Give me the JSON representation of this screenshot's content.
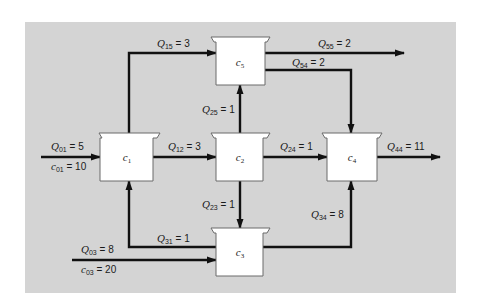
{
  "diagram": {
    "type": "reactor-network",
    "background_color": "#d4d4d4",
    "reactors": [
      {
        "id": "1",
        "symbol": "c",
        "sub": "1"
      },
      {
        "id": "2",
        "symbol": "c",
        "sub": "2"
      },
      {
        "id": "3",
        "symbol": "c",
        "sub": "3"
      },
      {
        "id": "4",
        "symbol": "c",
        "sub": "4"
      },
      {
        "id": "5",
        "symbol": "c",
        "sub": "5"
      }
    ],
    "flows": {
      "q01": {
        "sym": "Q",
        "sub": "01",
        "val": " = 5"
      },
      "c01": {
        "sym": "c",
        "sub": "01",
        "val": " = 10"
      },
      "q12": {
        "sym": "Q",
        "sub": "12",
        "val": " = 3"
      },
      "q15": {
        "sym": "Q",
        "sub": "15",
        "val": " = 3"
      },
      "q25": {
        "sym": "Q",
        "sub": "25",
        "val": " = 1"
      },
      "q24": {
        "sym": "Q",
        "sub": "24",
        "val": " = 1"
      },
      "q23": {
        "sym": "Q",
        "sub": "23",
        "val": " = 1"
      },
      "q55": {
        "sym": "Q",
        "sub": "55",
        "val": " = 2"
      },
      "q54": {
        "sym": "Q",
        "sub": "54",
        "val": " = 2"
      },
      "q44": {
        "sym": "Q",
        "sub": "44",
        "val": " = 11"
      },
      "q34": {
        "sym": "Q",
        "sub": "34",
        "val": " = 8"
      },
      "q31": {
        "sym": "Q",
        "sub": "31",
        "val": " = 1"
      },
      "q03": {
        "sym": "Q",
        "sub": "03",
        "val": " = 8"
      },
      "c03": {
        "sym": "c",
        "sub": "03",
        "val": " = 20"
      }
    }
  }
}
